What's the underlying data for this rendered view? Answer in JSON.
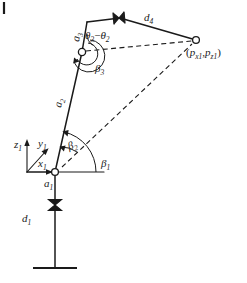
{
  "figure": {
    "type": "kinematic-schematic",
    "title": "",
    "background_color": "#ffffff",
    "stroke_color": "#1a1a1a",
    "width": 247,
    "height": 283
  },
  "labels": {
    "a1": {
      "base": "a",
      "sub": "1"
    },
    "a2": {
      "base": "a",
      "sub": "2"
    },
    "a3": {
      "base": "a",
      "sub": "3"
    },
    "d1": {
      "base": "d",
      "sub": "1"
    },
    "d4": {
      "base": "d",
      "sub": "4"
    },
    "beta1": {
      "base": "β",
      "sub": "1"
    },
    "beta2": {
      "base": "β",
      "sub": "2"
    },
    "beta3": {
      "base": "β",
      "sub": "3"
    },
    "theta3": {
      "base": "θ",
      "sub": "3"
    },
    "minus": "−",
    "theta2": {
      "base": "θ",
      "sub": "2"
    },
    "x1": {
      "base": "x",
      "sub": "1"
    },
    "y1": {
      "base": "y",
      "sub": "1"
    },
    "z1": {
      "base": "z",
      "sub": "1"
    },
    "endpoint": {
      "open_paren": "(",
      "px": "p",
      "px_sub": "x1",
      "comma": ",",
      "pz": "p",
      "pz_sub": "z1",
      "close_paren": ")"
    }
  },
  "geometry": {
    "origin_joint": {
      "x": 55,
      "y": 172
    },
    "middle_joint": {
      "x": 82,
      "y": 52
    },
    "elbow_corner": {
      "x": 87,
      "y": 22
    },
    "prismatic_top": {
      "x": 120,
      "y": 18
    },
    "endpoint": {
      "x": 196,
      "y": 40
    },
    "base_prismatic": {
      "x": 55,
      "y": 205
    },
    "ground_y": 268,
    "frame_origin": {
      "x": 40,
      "y": 172
    }
  }
}
